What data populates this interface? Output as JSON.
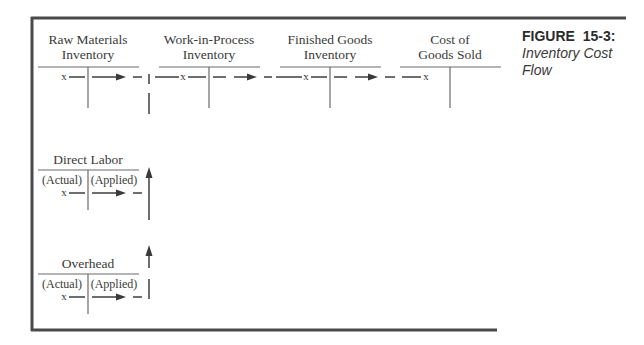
{
  "figure": {
    "label": "FIGURE  15-3:",
    "caption_line1": "Inventory Cost",
    "caption_line2": "Flow"
  },
  "accounts": {
    "raw_materials": {
      "title_line1": "Raw Materials",
      "title_line2": "Inventory",
      "entry": "x"
    },
    "work_in_process": {
      "title_line1": "Work-in-Process",
      "title_line2": "Inventory",
      "entry": "x"
    },
    "finished_goods": {
      "title_line1": "Finished Goods",
      "title_line2": "Inventory",
      "entry": "x"
    },
    "cost_of_goods_sold": {
      "title_line1": "Cost of",
      "title_line2": "Goods Sold",
      "entry": "x"
    },
    "direct_labor": {
      "title": "Direct Labor",
      "left_label": "(Actual)",
      "right_label": "(Applied)",
      "entry": "x"
    },
    "overhead": {
      "title": "Overhead",
      "left_label": "(Actual)",
      "right_label": "(Applied)",
      "entry": "x"
    }
  },
  "flows": [
    {
      "from": "Raw Materials Inventory",
      "to": "Work-in-Process Inventory"
    },
    {
      "from": "Direct Labor",
      "to": "Work-in-Process Inventory"
    },
    {
      "from": "Overhead",
      "to": "Work-in-Process Inventory"
    },
    {
      "from": "Work-in-Process Inventory",
      "to": "Finished Goods Inventory"
    },
    {
      "from": "Finished Goods Inventory",
      "to": "Cost of Goods Sold"
    }
  ]
}
